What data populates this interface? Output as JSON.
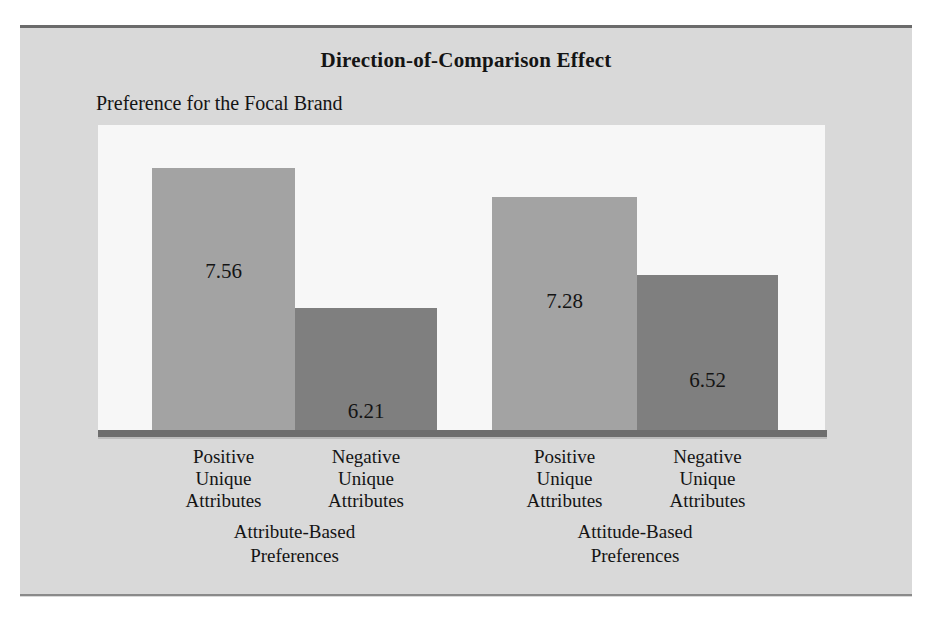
{
  "figure": {
    "title": "Direction-of-Comparison Effect",
    "y_axis_label": "Preference for the Focal Brand",
    "panel_background": "#d9d9d9",
    "plot_background": "#f7f7f7",
    "rule_color": "#6b6b6b",
    "baseline_color": "#6e6e6e"
  },
  "chart_data": {
    "type": "bar",
    "title": "Direction-of-Comparison Effect",
    "xlabel": "",
    "ylabel": "Preference for the Focal Brand",
    "ylim": [
      5.0,
      8.0
    ],
    "grid": false,
    "legend": null,
    "groups": [
      {
        "name": "Attribute-Based Preferences",
        "label_lines": [
          "Attribute-Based",
          "Preferences"
        ]
      },
      {
        "name": "Attitude-Based Preferences",
        "label_lines": [
          "Attitude-Based",
          "Preferences"
        ]
      }
    ],
    "categories": [
      "Positive Unique Attributes",
      "Negative Unique Attributes",
      "Positive Unique Attributes",
      "Negative Unique Attributes"
    ],
    "values": [
      7.56,
      6.21,
      7.28,
      6.52
    ],
    "bars": [
      {
        "group": "Attribute-Based Preferences",
        "category": "Positive Unique Attributes",
        "category_lines": [
          "Positive",
          "Unique",
          "Attributes"
        ],
        "value": 7.56,
        "value_text": "7.56",
        "color": "#a3a3a3",
        "left": 54,
        "width": 143,
        "height": 265,
        "value_left": 54,
        "value_top": 134
      },
      {
        "group": "Attribute-Based Preferences",
        "category": "Negative Unique Attributes",
        "category_lines": [
          "Negative",
          "Unique",
          "Attributes"
        ],
        "value": 6.21,
        "value_text": "6.21",
        "color": "#7f7f7f",
        "left": 197,
        "width": 142,
        "height": 125,
        "value_left": 197,
        "value_top": 274
      },
      {
        "group": "Attitude-Based Preferences",
        "category": "Positive Unique Attributes",
        "category_lines": [
          "Positive",
          "Unique",
          "Attributes"
        ],
        "value": 7.28,
        "value_text": "7.28",
        "color": "#a3a3a3",
        "left": 394,
        "width": 145,
        "height": 236,
        "value_left": 394,
        "value_top": 164
      },
      {
        "group": "Attitude-Based Preferences",
        "category": "Negative Unique Attributes",
        "category_lines": [
          "Negative",
          "Unique",
          "Attributes"
        ],
        "value": 6.52,
        "value_text": "6.52",
        "color": "#7f7f7f",
        "left": 539,
        "width": 141,
        "height": 158,
        "value_left": 539,
        "value_top": 243
      }
    ]
  }
}
